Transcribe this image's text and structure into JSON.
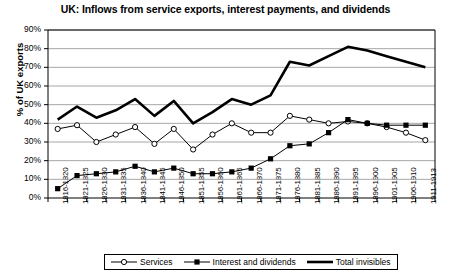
{
  "chart_data": {
    "type": "line",
    "title": "UK: Inflows from service exports, interest payments, and dividends",
    "xlabel": "",
    "ylabel": "% of UK exports",
    "ylim": [
      0,
      90
    ],
    "ytick_labels": [
      "90%",
      "80%",
      "70%",
      "60%",
      "50%",
      "40%",
      "30%",
      "20%",
      "10%",
      "0%"
    ],
    "ytick_values": [
      90,
      80,
      70,
      60,
      50,
      40,
      30,
      20,
      10,
      0
    ],
    "grid": true,
    "legend_position": "bottom",
    "categories": [
      "1816-1820",
      "1821-1825",
      "1826-1830",
      "1831-1835",
      "1836-1840",
      "1841-1845",
      "1846-1850",
      "1851-1855",
      "1856-1860",
      "1861-1865",
      "1866-1870",
      "1871-1875",
      "1876-1880",
      "1881-1885",
      "1886-1890",
      "1891-1895",
      "1896-1900",
      "1901-1905",
      "1906-1910",
      "1911-1913"
    ],
    "series": [
      {
        "name": "Services",
        "marker": "open-circle",
        "color": "#000000",
        "values": [
          37,
          39,
          30,
          34,
          38,
          29,
          37,
          26,
          34,
          40,
          35,
          35,
          44,
          42,
          40,
          41,
          40,
          38,
          35,
          31
        ]
      },
      {
        "name": "Interest and dividends",
        "marker": "filled-square",
        "color": "#000000",
        "values": [
          5,
          12,
          13,
          14,
          17,
          14,
          16,
          13,
          13,
          14,
          16,
          21,
          28,
          29,
          35,
          42,
          40,
          39,
          39,
          39
        ]
      },
      {
        "name": "Total invisibles",
        "marker": "none",
        "color": "#000000",
        "values": [
          42,
          49,
          43,
          47,
          53,
          44,
          52,
          40,
          46,
          53,
          50,
          55,
          73,
          71,
          76,
          81,
          79,
          76,
          73,
          70
        ]
      }
    ]
  },
  "legend": {
    "items": [
      {
        "label": "Services",
        "marker": "open-circle-marker"
      },
      {
        "label": "Interest and dividends",
        "marker": "filled-square-marker"
      },
      {
        "label": "Total invisibles",
        "marker": "thick-line-marker"
      }
    ]
  }
}
